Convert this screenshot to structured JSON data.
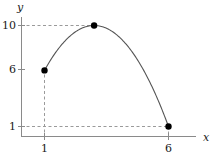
{
  "chart_data": {
    "type": "line",
    "title": "",
    "subtitle": "",
    "xlabel": "x",
    "ylabel": "y",
    "xlim": [
      0,
      7.2
    ],
    "ylim": [
      0,
      11.6
    ],
    "grid": false,
    "legend": null,
    "curve": {
      "name": "parabola",
      "description": "downward-opening parabola through the marked points",
      "vertex": {
        "x": 3,
        "y": 10
      },
      "x": [
        1,
        1.5,
        2,
        2.5,
        3,
        3.5,
        4,
        4.5,
        5,
        5.5,
        6
      ],
      "y": [
        6,
        8,
        9.25,
        9.8,
        10,
        9.75,
        9,
        7.8,
        6.2,
        3.9,
        1
      ],
      "color": "#555555",
      "width": 1
    },
    "points": [
      {
        "x": 1,
        "y": 6,
        "label": ""
      },
      {
        "x": 3,
        "y": 10,
        "label": ""
      },
      {
        "x": 6,
        "y": 1,
        "label": ""
      }
    ],
    "point_color": "#000000",
    "xticks": [
      {
        "value": 1,
        "label": "1"
      },
      {
        "value": 6,
        "label": "6"
      }
    ],
    "yticks": [
      {
        "value": 10,
        "label": "10"
      },
      {
        "value": 6,
        "label": "6"
      },
      {
        "value": 1,
        "label": "1"
      }
    ],
    "guides": [
      {
        "orientation": "horizontal",
        "at": 10,
        "from": 0,
        "to": 3,
        "style": "dashed"
      },
      {
        "orientation": "horizontal",
        "at": 1,
        "from": 0,
        "to": 6,
        "style": "dashed"
      },
      {
        "orientation": "vertical",
        "at": 1,
        "from": 0,
        "to": 6,
        "style": "dashed"
      },
      {
        "orientation": "vertical",
        "at": 6,
        "from": 0,
        "to": 1,
        "style": "dashed"
      }
    ],
    "guide_color": "#999999",
    "axis_color": "#808080"
  },
  "axes": {
    "x_name": "x",
    "y_name": "y"
  },
  "labels": {
    "y10": "10",
    "y6": "6",
    "y1": "1",
    "x1": "1",
    "x6": "6"
  }
}
